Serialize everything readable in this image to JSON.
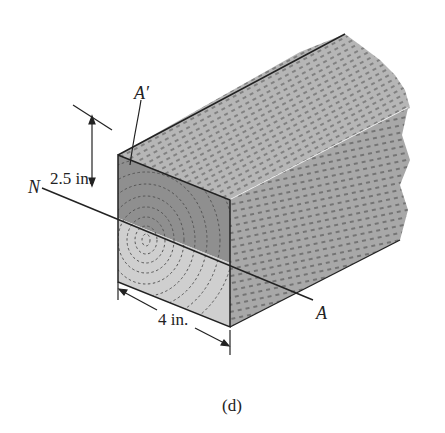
{
  "figure": {
    "caption": "(d)",
    "labels": {
      "top_axis": "A′",
      "neutral_left": "N",
      "neutral_right": "A",
      "height_dim": "2.5 in.",
      "width_dim": "4 in."
    },
    "colors": {
      "top_face": "#b4b4b4",
      "right_face": "#a9a9a9",
      "front_upper": "#8f8f8f",
      "front_lower": "#cfcfcf",
      "line": "#222222",
      "grain": "#555555"
    }
  }
}
